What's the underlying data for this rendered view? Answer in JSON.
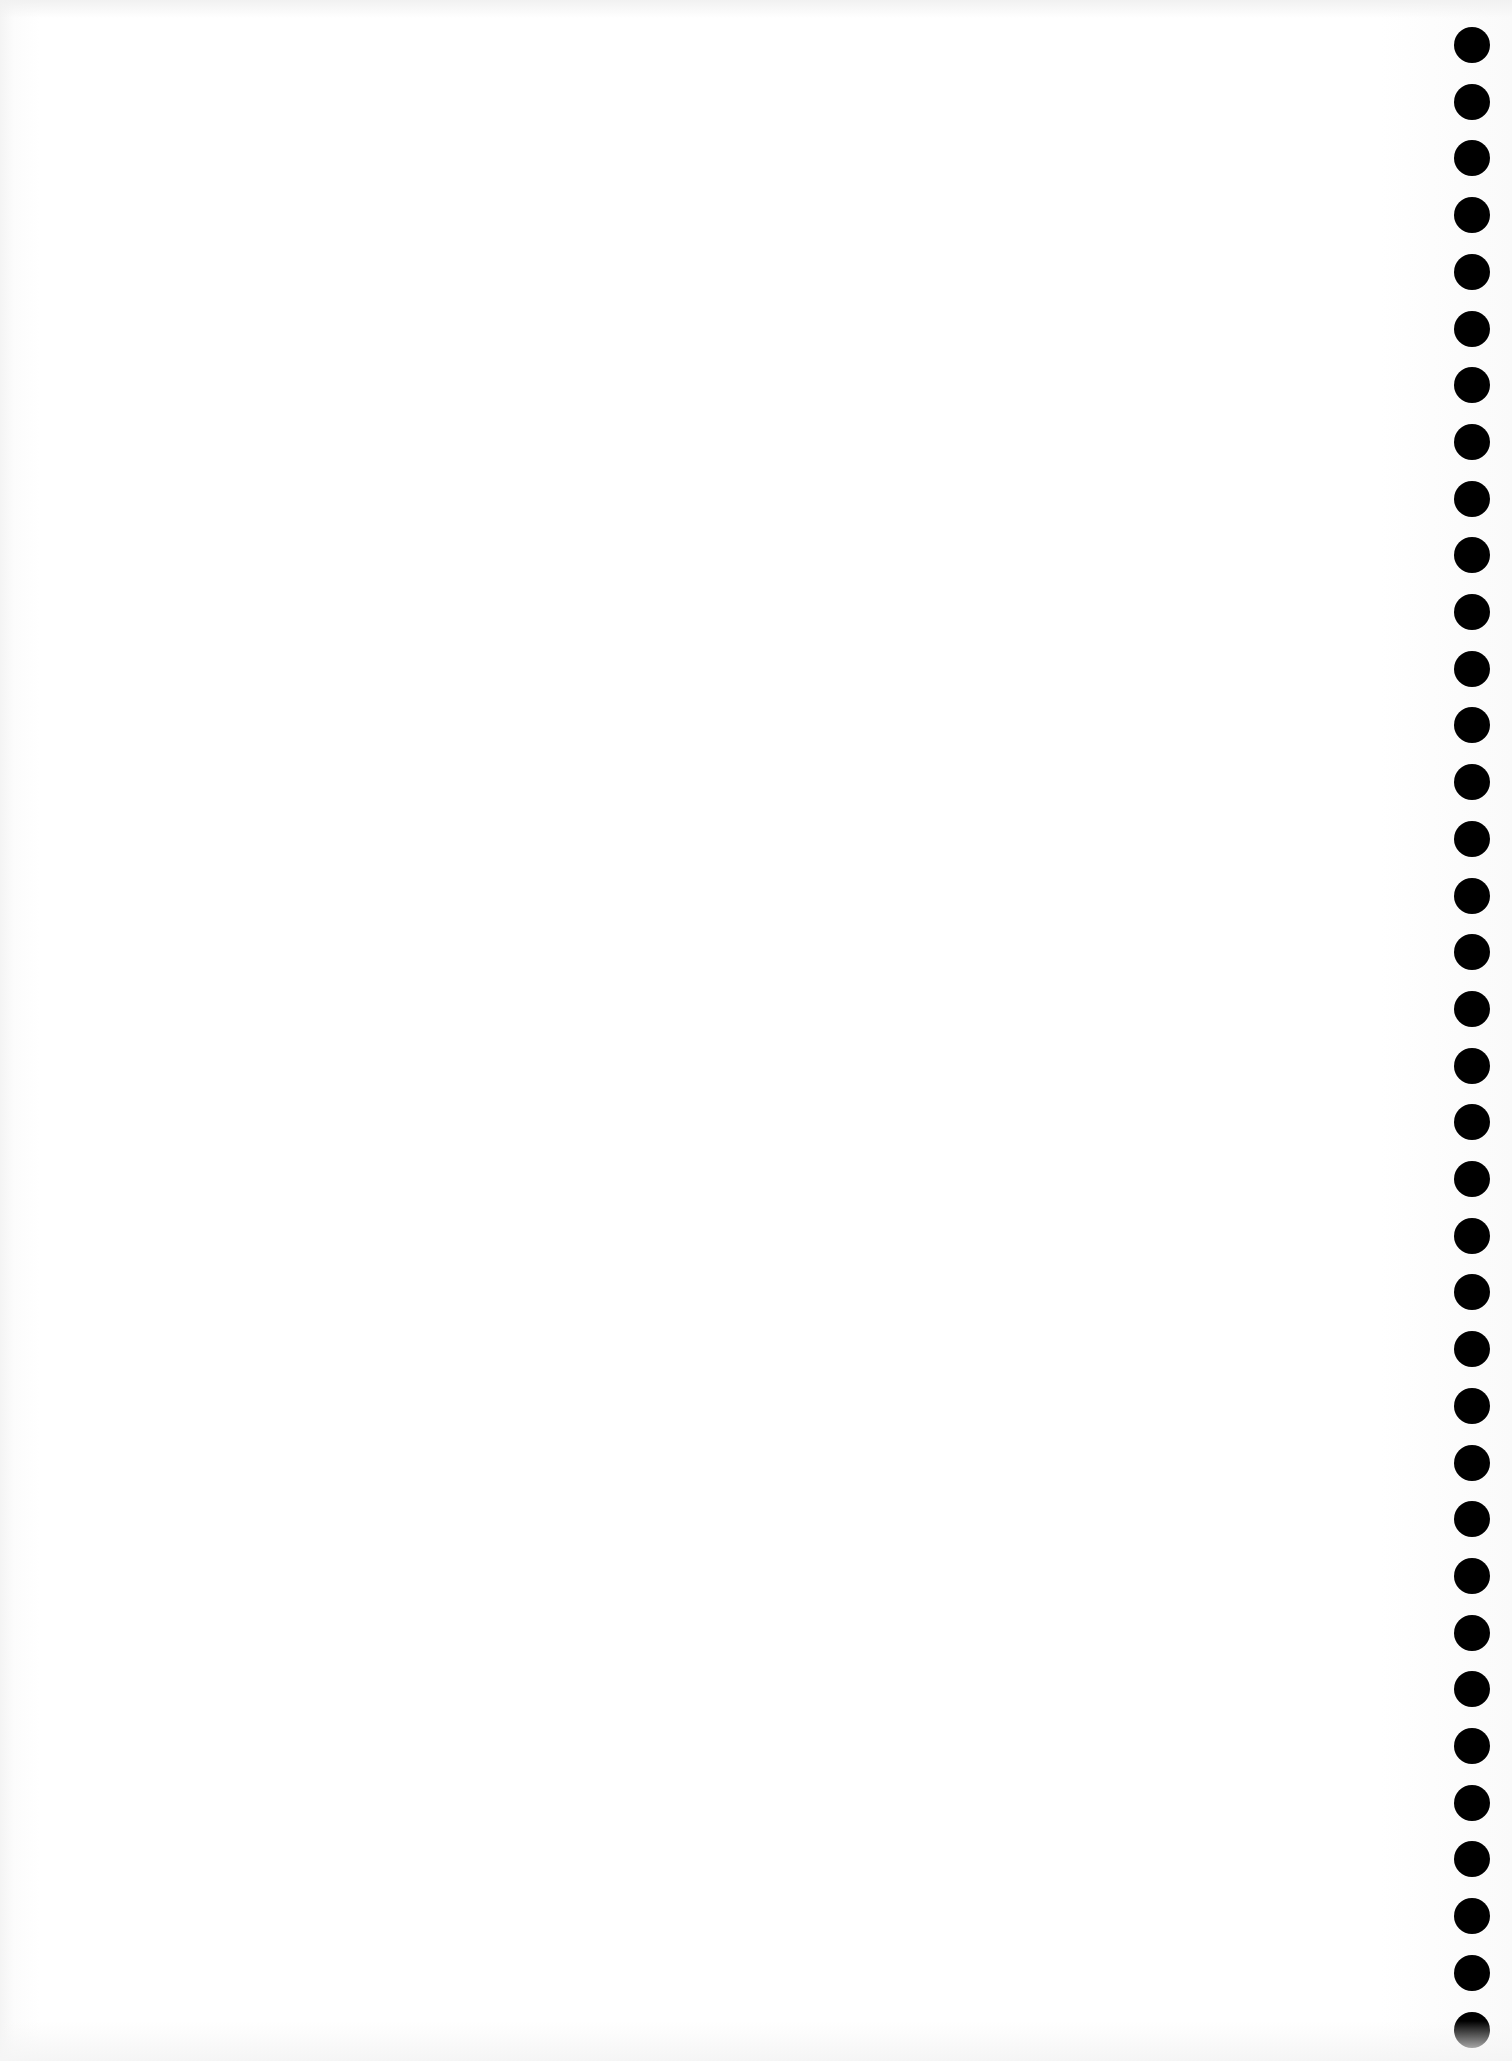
{
  "page": {
    "type": "scanned-blank-sheet",
    "background_color": "#ffffff",
    "text": ""
  },
  "punch_holes": {
    "count": 36,
    "color": "#000000",
    "center_x": 1472,
    "first_center_y": 45,
    "spacing": 56.7,
    "diameter": 36
  }
}
